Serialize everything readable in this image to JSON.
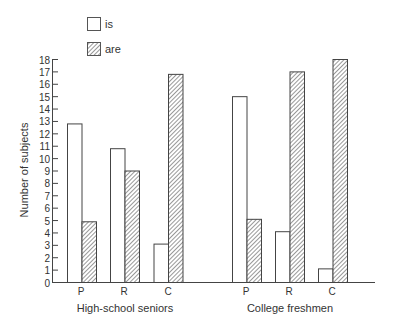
{
  "legend": {
    "items": [
      {
        "label": "is",
        "pattern": "open"
      },
      {
        "label": "are",
        "pattern": "hatched"
      }
    ]
  },
  "axis": {
    "ylabel": "Number of subjects",
    "yticks": [
      "0",
      "1",
      "2",
      "3",
      "4",
      "5",
      "6",
      "7",
      "8",
      "9",
      "10",
      "11",
      "12",
      "13",
      "14",
      "15",
      "16",
      "17",
      "18"
    ]
  },
  "groups": [
    {
      "label": "High-school seniors",
      "categories": [
        "P",
        "R",
        "C"
      ]
    },
    {
      "label": "College freshmen",
      "categories": [
        "P",
        "R",
        "C"
      ]
    }
  ],
  "chart_data": {
    "type": "bar",
    "title": "",
    "xlabel": "",
    "ylabel": "Number of subjects",
    "ylim": [
      0,
      18
    ],
    "grid": false,
    "legend_position": "top-left",
    "groups": [
      "High-school seniors",
      "College freshmen"
    ],
    "categories": [
      "P",
      "R",
      "C"
    ],
    "series": [
      {
        "name": "is",
        "pattern": "open",
        "values": {
          "High-school seniors": [
            12.8,
            10.8,
            3.1
          ],
          "College freshmen": [
            15.0,
            4.1,
            1.1
          ]
        }
      },
      {
        "name": "are",
        "pattern": "hatched",
        "values": {
          "High-school seniors": [
            4.9,
            9.0,
            16.8
          ],
          "College freshmen": [
            5.1,
            17.0,
            18.0
          ]
        }
      }
    ]
  }
}
